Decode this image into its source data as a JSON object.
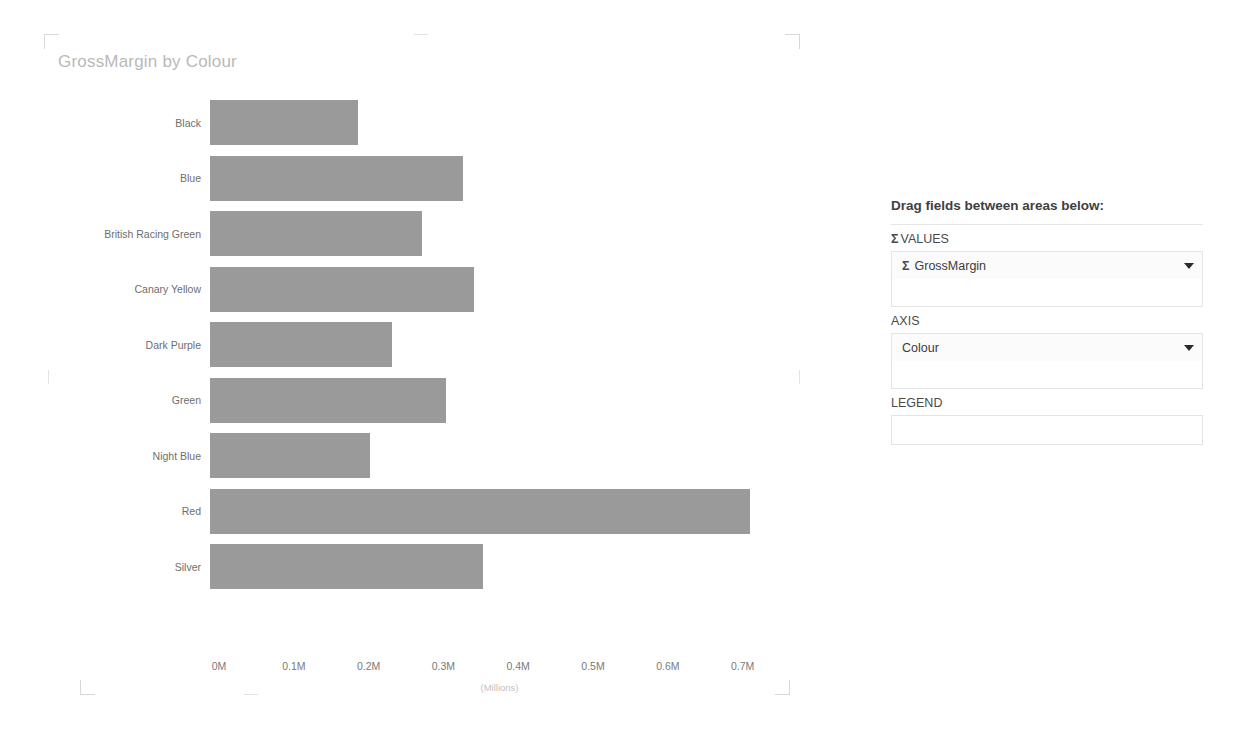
{
  "chart": {
    "title": "GrossMargin by Colour"
  },
  "chart_data": {
    "type": "bar",
    "orientation": "horizontal",
    "title": "GrossMargin by Colour",
    "xlabel": "(Millions)",
    "ylabel": "",
    "categories": [
      "Black",
      "Blue",
      "British Racing Green",
      "Canary Yellow",
      "Dark Purple",
      "Green",
      "Night Blue",
      "Red",
      "Silver"
    ],
    "values": [
      0.195,
      0.333,
      0.279,
      0.348,
      0.239,
      0.31,
      0.211,
      0.711,
      0.359
    ],
    "value_unit": "Millions",
    "xlim": [
      0,
      0.75
    ],
    "xticks": [
      0,
      0.1,
      0.2,
      0.3,
      0.4,
      0.5,
      0.6,
      0.7
    ],
    "xtick_labels": [
      "0M",
      "0.1M",
      "0.2M",
      "0.3M",
      "0.4M",
      "0.5M",
      "0.6M",
      "0.7M"
    ],
    "grid": false,
    "legend": null,
    "bar_color": "#9a9a9a",
    "series": [
      {
        "name": "GrossMargin",
        "values": [
          0.195,
          0.333,
          0.279,
          0.348,
          0.239,
          0.31,
          0.211,
          0.711,
          0.359
        ]
      }
    ]
  },
  "field_well": {
    "heading": "Drag fields between areas below:",
    "sections": [
      {
        "sigma": "Σ",
        "title": "VALUES",
        "fields": [
          {
            "sigma": "Σ",
            "label": "GrossMargin",
            "caret": "chevron-down-icon"
          }
        ]
      },
      {
        "sigma": "",
        "title": "AXIS",
        "fields": [
          {
            "sigma": "",
            "label": "Colour",
            "caret": "chevron-down-icon"
          }
        ]
      },
      {
        "sigma": "",
        "title": "LEGEND",
        "fields": []
      }
    ]
  }
}
